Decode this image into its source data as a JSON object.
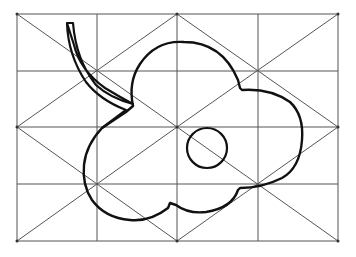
{
  "figure": {
    "title": "Leaf drawing on construction grid",
    "grid": {
      "columns": 4,
      "rows": 4,
      "x_lines": [
        17,
        97,
        177,
        258,
        338
      ],
      "y_lines": [
        14,
        71,
        127,
        184,
        241
      ]
    },
    "colors": {
      "background": "#ffffff",
      "grid_line": "#555555",
      "outline": "#111111"
    }
  }
}
